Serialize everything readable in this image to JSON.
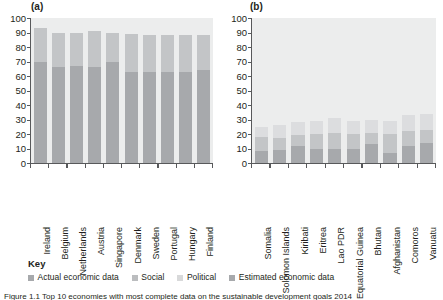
{
  "figure": {
    "caption": "Figure 1.1  Top 10 economies with most complete data on the sustainable development goals 2014"
  },
  "key": {
    "title": "Key",
    "items": [
      {
        "label": "Actual economic data",
        "color": "#a7a9ac"
      },
      {
        "label": "Social",
        "color": "#bbbdbf"
      },
      {
        "label": "Political",
        "color": "#d8d9da"
      },
      {
        "label": "Estimated economic data",
        "color": "#a7a9ac"
      }
    ]
  },
  "colors": {
    "plot_background": "#eceded",
    "actual_economic": "#a7a9ac",
    "social": "#c3c5c7",
    "political": "#dcdddf",
    "estimated_economic": "#b0b2b4",
    "axis": "#58595b",
    "text": "#231f20"
  },
  "chart_data": [
    {
      "type": "bar",
      "panel": "(a)",
      "title": "(a)",
      "stacked": true,
      "xlabel": "",
      "ylabel": "",
      "ylim": [
        0,
        100
      ],
      "yticks": [
        0,
        10,
        20,
        30,
        40,
        50,
        60,
        70,
        80,
        90,
        100
      ],
      "grid": false,
      "legend_position": "below-figure",
      "categories": [
        "Ireland",
        "Belgium",
        "Netherlands",
        "Austria",
        "Singapore",
        "Denmark",
        "Sweden",
        "Portugal",
        "Hungary",
        "Finland"
      ],
      "series": [
        {
          "name": "Actual economic data",
          "values": [
            70,
            66,
            67,
            66,
            70,
            63,
            63,
            63,
            63,
            64
          ]
        },
        {
          "name": "Social",
          "values": [
            23,
            24,
            23,
            25,
            20,
            26,
            25,
            25,
            25,
            24
          ]
        },
        {
          "name": "Political",
          "values": [
            0,
            0,
            0,
            0,
            0,
            0,
            0,
            0,
            0,
            0
          ]
        },
        {
          "name": "Estimated economic data",
          "values": [
            0,
            0,
            0,
            0,
            0,
            0,
            0,
            0,
            0,
            0
          ]
        }
      ],
      "totals": [
        93,
        90,
        90,
        91,
        90,
        89,
        88,
        88,
        88,
        88
      ]
    },
    {
      "type": "bar",
      "panel": "(b)",
      "title": "(b)",
      "stacked": true,
      "xlabel": "",
      "ylabel": "",
      "ylim": [
        0,
        100
      ],
      "yticks": [
        0,
        10,
        20,
        30,
        40,
        50,
        60,
        70,
        80,
        90,
        100
      ],
      "grid": false,
      "legend_position": "below-figure",
      "categories": [
        "Somalia",
        "Solomon Islands",
        "Kiribati",
        "Eritrea",
        "Lao PDR",
        "Equatorial Guinea",
        "Bhutan",
        "Afghanistan",
        "Comoros",
        "Vanuatu"
      ],
      "series": [
        {
          "name": "Actual economic data",
          "values": [
            8,
            9,
            12,
            10,
            10,
            10,
            13,
            7,
            12,
            14
          ]
        },
        {
          "name": "Social",
          "values": [
            10,
            8,
            7,
            10,
            11,
            10,
            8,
            13,
            10,
            9
          ]
        },
        {
          "name": "Political",
          "values": [
            7,
            9,
            9,
            9,
            10,
            9,
            9,
            9,
            11,
            11
          ]
        },
        {
          "name": "Estimated economic data",
          "values": [
            0,
            0,
            0,
            0,
            0,
            0,
            0,
            0,
            0,
            0
          ]
        }
      ],
      "totals": [
        25,
        26,
        28,
        29,
        31,
        29,
        30,
        29,
        33,
        34
      ]
    }
  ]
}
